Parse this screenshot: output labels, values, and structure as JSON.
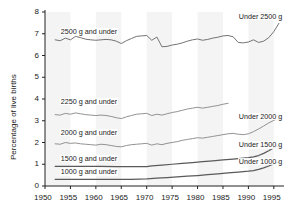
{
  "chart_data": {
    "type": "line",
    "title": "",
    "subtitle": "",
    "xlabel": "",
    "ylabel": "Percentage of live births",
    "xlim": [
      1950,
      1997
    ],
    "ylim": [
      0,
      8
    ],
    "grid": false,
    "legend_position": "inline-labels",
    "x_ticks": [
      "1950",
      "1955",
      "1960",
      "1965",
      "1970",
      "1975",
      "1980",
      "1985",
      "1990",
      "1995"
    ],
    "x_tick_values": [
      1950,
      1955,
      1960,
      1965,
      1970,
      1975,
      1980,
      1985,
      1990,
      1995
    ],
    "y_ticks": [
      "0",
      "1",
      "2",
      "3",
      "4",
      "5",
      "6",
      "7",
      "8"
    ],
    "y_tick_values": [
      0,
      1,
      2,
      3,
      4,
      5,
      6,
      7,
      8
    ],
    "annotations": [
      {
        "name": "label-2500-left",
        "text": "2500 g and under",
        "x": 1953.0,
        "y": 7.05
      },
      {
        "name": "label-2500-right",
        "text": "Under 2500 g",
        "x": 1988.0,
        "y": 7.72
      },
      {
        "name": "label-2250-left",
        "text": "2250 g and under",
        "x": 1953.0,
        "y": 3.82
      },
      {
        "name": "label-2000-left",
        "text": "2000 g and under",
        "x": 1953.0,
        "y": 2.38
      },
      {
        "name": "label-2000-right",
        "text": "Under 2000 g",
        "x": 1988.0,
        "y": 3.12
      },
      {
        "name": "label-1500-left",
        "text": "1500 g and under",
        "x": 1953.0,
        "y": 1.2
      },
      {
        "name": "label-1500-right",
        "text": "Under 1500 g",
        "x": 1988.0,
        "y": 1.82
      },
      {
        "name": "label-1000-left",
        "text": "1000 g and under",
        "x": 1953.0,
        "y": 0.58
      },
      {
        "name": "label-1000-right",
        "text": "Under 1000 g",
        "x": 1988.0,
        "y": 1.08
      }
    ],
    "series": [
      {
        "name": "2500 g and under",
        "color": "#6b6b6b",
        "x": [
          1952,
          1953,
          1954,
          1955,
          1956,
          1957,
          1958,
          1959,
          1960,
          1961,
          1962,
          1963,
          1964,
          1965,
          1966,
          1967,
          1968,
          1969,
          1970,
          1971,
          1972,
          1973,
          1974,
          1975,
          1976,
          1977,
          1978,
          1979,
          1980,
          1981,
          1982,
          1983,
          1984,
          1985,
          1986,
          1987,
          1988,
          1989,
          1990,
          1991,
          1992,
          1993,
          1994,
          1995,
          1996
        ],
        "values": [
          6.72,
          6.68,
          6.8,
          6.72,
          6.88,
          6.82,
          6.75,
          6.72,
          6.7,
          6.72,
          6.74,
          6.72,
          6.66,
          6.55,
          6.68,
          6.78,
          6.88,
          6.9,
          6.92,
          6.7,
          6.85,
          6.4,
          6.42,
          6.48,
          6.52,
          6.58,
          6.66,
          6.72,
          6.76,
          6.7,
          6.74,
          6.8,
          6.84,
          6.9,
          6.92,
          6.86,
          6.6,
          6.58,
          6.62,
          6.72,
          6.6,
          6.66,
          6.82,
          7.1,
          7.48
        ]
      },
      {
        "name": "2250 g and under",
        "color": "#8c8c8c",
        "x": [
          1952,
          1953,
          1954,
          1955,
          1956,
          1957,
          1958,
          1959,
          1960,
          1961,
          1962,
          1963,
          1964,
          1965,
          1966,
          1967,
          1968,
          1969,
          1970,
          1971,
          1972,
          1973,
          1974,
          1975,
          1976,
          1977,
          1978,
          1979,
          1980,
          1981,
          1982,
          1983,
          1984,
          1985,
          1986
        ],
        "values": [
          3.28,
          3.26,
          3.34,
          3.3,
          3.36,
          3.32,
          3.28,
          3.26,
          3.24,
          3.26,
          3.24,
          3.2,
          3.14,
          3.1,
          3.18,
          3.24,
          3.3,
          3.32,
          3.34,
          3.24,
          3.3,
          3.26,
          3.32,
          3.38,
          3.42,
          3.48,
          3.54,
          3.58,
          3.62,
          3.58,
          3.62,
          3.66,
          3.7,
          3.76,
          3.8
        ]
      },
      {
        "name": "2000 g and under",
        "color": "#8c8c8c",
        "x": [
          1952,
          1953,
          1954,
          1955,
          1956,
          1957,
          1958,
          1959,
          1960,
          1961,
          1962,
          1963,
          1964,
          1965,
          1966,
          1967,
          1968,
          1969,
          1970,
          1971,
          1972,
          1973,
          1974,
          1975,
          1976,
          1977,
          1978,
          1979,
          1980,
          1981,
          1982,
          1983,
          1984,
          1985,
          1986,
          1987,
          1988,
          1989,
          1990,
          1991,
          1992,
          1993,
          1994,
          1995,
          1996
        ],
        "values": [
          1.94,
          1.92,
          2.0,
          1.96,
          1.98,
          1.94,
          1.92,
          1.9,
          1.88,
          1.92,
          1.9,
          1.86,
          1.82,
          1.8,
          1.86,
          1.9,
          1.92,
          1.94,
          1.96,
          1.88,
          1.94,
          1.9,
          1.96,
          2.0,
          2.04,
          2.1,
          2.14,
          2.18,
          2.22,
          2.2,
          2.24,
          2.28,
          2.32,
          2.36,
          2.4,
          2.42,
          2.38,
          2.36,
          2.4,
          2.5,
          2.62,
          2.76,
          2.9,
          3.02,
          3.12
        ]
      },
      {
        "name": "1500 g and under",
        "color": "#5a5a5a",
        "x": [
          1952,
          1955,
          1958,
          1961,
          1964,
          1967,
          1970,
          1971,
          1973,
          1975,
          1977,
          1979,
          1981,
          1983,
          1985,
          1987,
          1989,
          1990,
          1991,
          1992,
          1993,
          1994,
          1995,
          1996
        ],
        "values": [
          0.9,
          0.9,
          0.9,
          0.9,
          0.89,
          0.89,
          0.89,
          0.92,
          0.96,
          1.0,
          1.04,
          1.08,
          1.12,
          1.16,
          1.2,
          1.24,
          1.28,
          1.3,
          1.34,
          1.4,
          1.5,
          1.62,
          1.76,
          1.86
        ]
      },
      {
        "name": "1000 g and under",
        "color": "#5a5a5a",
        "x": [
          1952,
          1956,
          1960,
          1964,
          1967,
          1970,
          1972,
          1974,
          1976,
          1978,
          1980,
          1982,
          1984,
          1986,
          1988,
          1990,
          1991,
          1992,
          1993,
          1994,
          1995,
          1996
        ],
        "values": [
          0.3,
          0.3,
          0.3,
          0.3,
          0.31,
          0.33,
          0.36,
          0.39,
          0.42,
          0.45,
          0.48,
          0.52,
          0.56,
          0.6,
          0.64,
          0.68,
          0.71,
          0.76,
          0.83,
          0.92,
          1.02,
          1.1
        ]
      }
    ]
  },
  "axes": {
    "y_axis_label": "Percentage of live births"
  }
}
